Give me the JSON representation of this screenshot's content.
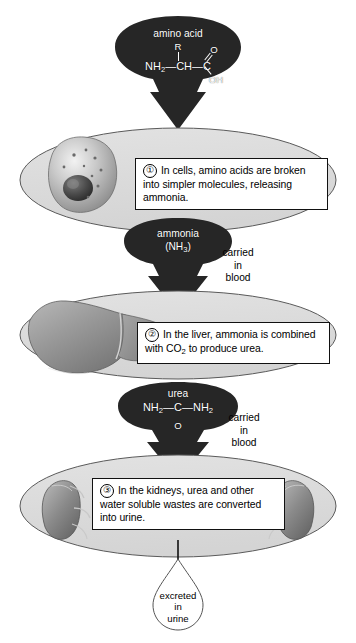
{
  "diagram": {
    "background_color": "#ffffff",
    "organ_ellipse_fill": "#dcdcdc",
    "blob_fill": "#262626",
    "blob_text_color": "#ffffff",
    "outline_color": "#111111"
  },
  "nodes": {
    "amino_acid": {
      "label": "amino acid",
      "formula": {
        "r_group": "R",
        "left": "NH",
        "left_sub": "2",
        "center": "CH",
        "carbon": "C",
        "double_bond_o": "O",
        "hydroxyl": "OH",
        "bond_left": "—",
        "bond_right": "—"
      }
    },
    "ammonia": {
      "label": "ammonia",
      "formula": "(NH",
      "formula_sub": "3",
      "formula_end": ")"
    },
    "urea": {
      "label": "urea",
      "formula_left": "NH",
      "formula_left_sub": "2",
      "formula_bond_left": "—",
      "formula_carbon": "C",
      "formula_bond_right": "—",
      "formula_right": "NH",
      "formula_right_sub": "2",
      "double_bond": "‖",
      "oxygen": "O"
    },
    "excreted": {
      "label": "excreted\nin\nurine"
    }
  },
  "transport_labels": [
    {
      "id": "blood-ammonia",
      "text": "carried\nin\nblood"
    },
    {
      "id": "blood-urea",
      "text": "carried\nin\nblood"
    }
  ],
  "steps": [
    {
      "number": "①",
      "organ": "cell",
      "text": "In cells, amino acids are broken into simpler molecules, releasing ammonia."
    },
    {
      "number": "②",
      "organ": "liver",
      "text_before": "In the liver, ammonia is combined with CO",
      "text_sub": "2",
      "text_after": " to produce urea."
    },
    {
      "number": "③",
      "organ": "kidneys",
      "text": "In the kidneys, urea and other water soluble wastes are converted into urine."
    }
  ]
}
